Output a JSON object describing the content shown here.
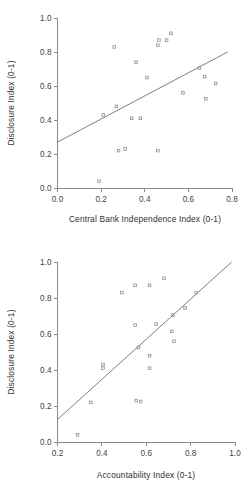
{
  "figures": [
    {
      "id": "central-bank-independence",
      "xlabel": "Central Bank Independence Index (0-1)",
      "ylabel": "Disclosure Index (0-1)"
    },
    {
      "id": "accountability",
      "xlabel": "Accountability Index (0-1)",
      "ylabel": "Disclosure Index (0-1)"
    }
  ],
  "chart_data": [
    {
      "type": "scatter",
      "title": "",
      "xlabel": "Central Bank Independence Index (0-1)",
      "ylabel": "Disclosure Index (0-1)",
      "xlim": [
        0.0,
        0.8
      ],
      "ylim": [
        0.0,
        1.0
      ],
      "xticks": [
        0.0,
        0.2,
        0.4,
        0.6,
        0.8
      ],
      "xtick_labels": [
        "0.0",
        "0.2",
        "0.4",
        "0.6",
        "0.8"
      ],
      "yticks": [
        0.0,
        0.2,
        0.4,
        0.6,
        0.8,
        1.0
      ],
      "ytick_labels": [
        "0.0",
        "0.2",
        "0.4",
        "0.6",
        "0.8",
        "1.0"
      ],
      "grid": false,
      "legend": null,
      "marker": "open-square",
      "marker_color": "#8e8e98",
      "points": [
        {
          "x": 0.19,
          "y": 0.04
        },
        {
          "x": 0.21,
          "y": 0.43
        },
        {
          "x": 0.26,
          "y": 0.83
        },
        {
          "x": 0.27,
          "y": 0.48
        },
        {
          "x": 0.28,
          "y": 0.22
        },
        {
          "x": 0.31,
          "y": 0.23
        },
        {
          "x": 0.34,
          "y": 0.41
        },
        {
          "x": 0.36,
          "y": 0.74
        },
        {
          "x": 0.38,
          "y": 0.41
        },
        {
          "x": 0.41,
          "y": 0.65
        },
        {
          "x": 0.46,
          "y": 0.22
        },
        {
          "x": 0.46,
          "y": 0.84
        },
        {
          "x": 0.465,
          "y": 0.87
        },
        {
          "x": 0.5,
          "y": 0.87
        },
        {
          "x": 0.52,
          "y": 0.91
        },
        {
          "x": 0.575,
          "y": 0.56
        },
        {
          "x": 0.65,
          "y": 0.705
        },
        {
          "x": 0.675,
          "y": 0.655
        },
        {
          "x": 0.68,
          "y": 0.525
        },
        {
          "x": 0.725,
          "y": 0.615
        }
      ],
      "fit_line": {
        "type": "linear",
        "x_start": 0.0,
        "y_start": 0.27,
        "x_end": 0.78,
        "y_end": 0.8,
        "color": "#6f6f7a"
      }
    },
    {
      "type": "scatter",
      "title": "",
      "xlabel": "Accountability Index (0-1)",
      "ylabel": "Disclosure Index (0-1)",
      "xlim": [
        0.2,
        1.0
      ],
      "ylim": [
        0.0,
        1.0
      ],
      "xticks": [
        0.2,
        0.4,
        0.6,
        0.8,
        1.0
      ],
      "xtick_labels": [
        "0.2",
        "0.4",
        "0.6",
        "0.8",
        "1.0"
      ],
      "yticks": [
        0.0,
        0.2,
        0.4,
        0.6,
        0.8,
        1.0
      ],
      "ytick_labels": [
        "0.0",
        "0.2",
        "0.4",
        "0.6",
        "0.8",
        "1.0"
      ],
      "grid": false,
      "legend": null,
      "marker": "open-square",
      "marker_color": "#8e8e98",
      "points": [
        {
          "x": 0.29,
          "y": 0.04
        },
        {
          "x": 0.35,
          "y": 0.22
        },
        {
          "x": 0.405,
          "y": 0.43
        },
        {
          "x": 0.405,
          "y": 0.41
        },
        {
          "x": 0.49,
          "y": 0.83
        },
        {
          "x": 0.55,
          "y": 0.87
        },
        {
          "x": 0.55,
          "y": 0.65
        },
        {
          "x": 0.555,
          "y": 0.23
        },
        {
          "x": 0.575,
          "y": 0.225
        },
        {
          "x": 0.565,
          "y": 0.525
        },
        {
          "x": 0.615,
          "y": 0.87
        },
        {
          "x": 0.615,
          "y": 0.48
        },
        {
          "x": 0.615,
          "y": 0.41
        },
        {
          "x": 0.645,
          "y": 0.655
        },
        {
          "x": 0.68,
          "y": 0.91
        },
        {
          "x": 0.715,
          "y": 0.615
        },
        {
          "x": 0.725,
          "y": 0.56
        },
        {
          "x": 0.72,
          "y": 0.705
        },
        {
          "x": 0.775,
          "y": 0.745
        },
        {
          "x": 0.825,
          "y": 0.83
        }
      ],
      "fit_line": {
        "type": "linear",
        "x_start": 0.2,
        "y_start": 0.125,
        "x_end": 0.985,
        "y_end": 1.0,
        "color": "#6f6f7a"
      }
    }
  ]
}
